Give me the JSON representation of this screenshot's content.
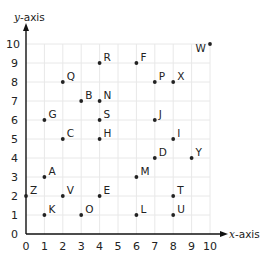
{
  "chart_data": {
    "type": "scatter",
    "title": "",
    "xlabel": "x-axis",
    "ylabel": "y-axis",
    "xlim": [
      0,
      10
    ],
    "ylim": [
      0,
      10
    ],
    "grid": true,
    "x_ticks": [
      "0",
      "1",
      "2",
      "3",
      "4",
      "5",
      "6",
      "7",
      "8",
      "9",
      "10"
    ],
    "y_ticks": [
      "0",
      "1",
      "2",
      "3",
      "4",
      "5",
      "6",
      "7",
      "8",
      "9",
      "10"
    ],
    "points": [
      {
        "label": "A",
        "x": 1,
        "y": 3
      },
      {
        "label": "B",
        "x": 3,
        "y": 7
      },
      {
        "label": "C",
        "x": 2,
        "y": 5
      },
      {
        "label": "D",
        "x": 7,
        "y": 4
      },
      {
        "label": "E",
        "x": 4,
        "y": 2
      },
      {
        "label": "F",
        "x": 6,
        "y": 9
      },
      {
        "label": "G",
        "x": 1,
        "y": 6
      },
      {
        "label": "H",
        "x": 4,
        "y": 5
      },
      {
        "label": "I",
        "x": 8,
        "y": 5
      },
      {
        "label": "J",
        "x": 7,
        "y": 6
      },
      {
        "label": "K",
        "x": 1,
        "y": 1
      },
      {
        "label": "L",
        "x": 6,
        "y": 1
      },
      {
        "label": "M",
        "x": 6,
        "y": 3
      },
      {
        "label": "N",
        "x": 4,
        "y": 7
      },
      {
        "label": "O",
        "x": 3,
        "y": 1
      },
      {
        "label": "P",
        "x": 7,
        "y": 8
      },
      {
        "label": "Q",
        "x": 2,
        "y": 8
      },
      {
        "label": "R",
        "x": 4,
        "y": 9
      },
      {
        "label": "S",
        "x": 4,
        "y": 6
      },
      {
        "label": "T",
        "x": 8,
        "y": 2
      },
      {
        "label": "U",
        "x": 8,
        "y": 1
      },
      {
        "label": "V",
        "x": 2,
        "y": 2
      },
      {
        "label": "W",
        "x": 10,
        "y": 10
      },
      {
        "label": "X",
        "x": 8,
        "y": 8
      },
      {
        "label": "Y",
        "x": 9,
        "y": 4
      },
      {
        "label": "Z",
        "x": 0,
        "y": 2
      }
    ],
    "colors": {
      "axis": "#111111",
      "grid": "#e8e8e8",
      "point": "#222222",
      "text": "#222222"
    }
  },
  "axes": {
    "x_label_var": "x",
    "x_label_rest": "-axis",
    "y_label_var": "y",
    "y_label_rest": "-axis"
  }
}
